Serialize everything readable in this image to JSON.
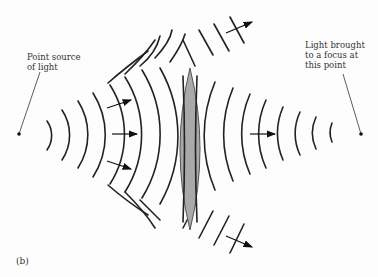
{
  "figure": {
    "panel_label": "(b)",
    "source_label_lines": [
      "Point source",
      "of light"
    ],
    "focus_label_lines": [
      "Light brought",
      "to a focus at",
      "this point"
    ]
  },
  "diagram": {
    "source_point": {
      "x": 19,
      "y": 134
    },
    "focus_point": {
      "x": 361,
      "y": 134
    },
    "lens": {
      "x": 190,
      "top": 68,
      "bottom": 230,
      "fill": "#a9a9a9",
      "stroke": "#555555"
    },
    "colors": {
      "wave": "#222222",
      "background": "#fdfdfd"
    }
  }
}
